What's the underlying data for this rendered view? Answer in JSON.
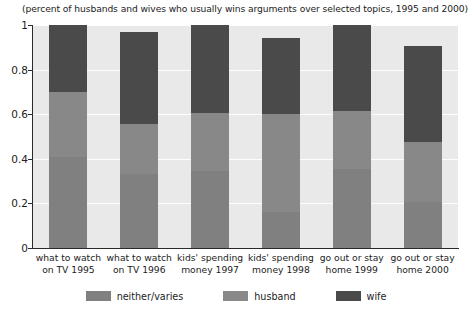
{
  "chart_data": {
    "type": "bar",
    "subtype": "stacked-column",
    "title": "(percent of husbands and wives who usually wins arguments over selected topics, 1995 and 2000)",
    "xlabel": "",
    "ylabel": "",
    "ylim": [
      0,
      1
    ],
    "yticks": [
      "0",
      "0.2",
      "0.4",
      "0.6",
      "0.8",
      "1"
    ],
    "ytick_values": [
      0,
      0.2,
      0.4,
      0.6,
      0.8,
      1
    ],
    "grid": true,
    "grid_axis": "y",
    "legend_position": "bottom",
    "plot_background": "#e9e9e9",
    "categories": [
      "what to watch on TV 1995",
      "what to watch on TV 1996",
      "kids' spending money 1997",
      "kids' spending money 1998",
      "go out or stay home 1999",
      "go out or stay home 2000"
    ],
    "category_lines": [
      [
        "what to watch",
        "on TV 1995"
      ],
      [
        "what to watch",
        "on TV 1996"
      ],
      [
        "kids' spending",
        "money 1997"
      ],
      [
        "kids' spending",
        "money 1998"
      ],
      [
        "go out or stay",
        "home 1999"
      ],
      [
        "go out or stay",
        "home 2000"
      ]
    ],
    "series": [
      {
        "name": "neither/varies",
        "color": "#808080",
        "values": [
          0.41,
          0.33,
          0.345,
          0.16,
          0.355,
          0.205
        ]
      },
      {
        "name": "husband",
        "color": "#888888",
        "values": [
          0.29,
          0.225,
          0.26,
          0.44,
          0.26,
          0.27
        ]
      },
      {
        "name": "wife",
        "color": "#4a4a4a",
        "values": [
          0.3,
          0.415,
          0.395,
          0.34,
          0.385,
          0.43
        ]
      }
    ],
    "totals": [
      1.0,
      0.97,
      1.0,
      0.94,
      1.0,
      0.905
    ]
  }
}
